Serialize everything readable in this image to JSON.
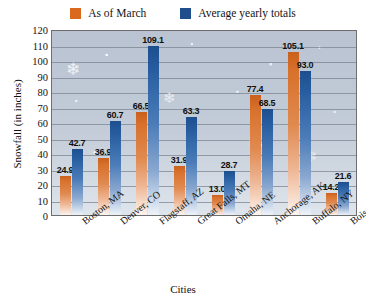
{
  "chart_data": {
    "type": "bar",
    "title": "",
    "xlabel": "Cities",
    "ylabel": "Snowfall (in inches)",
    "ylim": [
      0,
      120
    ],
    "ytick_step": 10,
    "yticks": [
      120,
      110,
      100,
      90,
      80,
      70,
      60,
      50,
      40,
      30,
      20,
      10,
      0
    ],
    "grid": true,
    "legend_position": "top-center",
    "categories": [
      "Boston, MA",
      "Denver, CO",
      "Flagstaff, AZ",
      "Great Falls, MT",
      "Omaha, NE",
      "Anchorage, AK",
      "Buffalo, NY",
      "Boise, ID"
    ],
    "series": [
      {
        "name": "As of March",
        "color": "#d9691f",
        "values": [
          24.9,
          36.9,
          66.5,
          31.9,
          13.0,
          77.4,
          105.1,
          14.2
        ]
      },
      {
        "name": "Average yearly totals",
        "color": "#1f4e8c",
        "values": [
          42.7,
          60.7,
          109.1,
          63.3,
          28.7,
          68.5,
          93.0,
          21.6
        ]
      }
    ]
  },
  "legend": {
    "items": [
      {
        "label": "As of March",
        "color": "#d9691f"
      },
      {
        "label": "Average yearly totals",
        "color": "#1f4e8c"
      }
    ]
  },
  "axes": {
    "y_title": "Snowfall (in inches)",
    "x_title": "Cities"
  }
}
